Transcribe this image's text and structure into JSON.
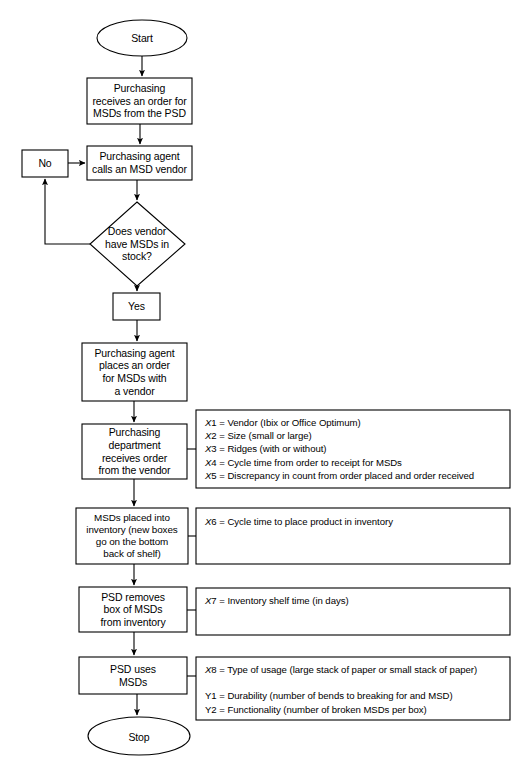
{
  "diagram": {
    "background_color": "#ffffff",
    "line_color": "#000000"
  },
  "flow": {
    "start": "Start",
    "stop": "Stop",
    "steps": [
      {
        "id": "receives-order",
        "text": "Purchasing\nreceives an order for\nMSDs from the PSD"
      },
      {
        "id": "calls-vendor",
        "text": "Purchasing agent\ncalls an MSD vendor"
      },
      {
        "id": "places-order",
        "text": "Purchasing agent\nplaces an order\nfor MSDs with\na vendor"
      },
      {
        "id": "receives-from-vendor",
        "text": "Purchasing\ndepartment\nreceives order\nfrom the vendor"
      },
      {
        "id": "placed-into-inventory",
        "text": "MSDs placed into\ninventory (new boxes\ngo on the bottom\nback of shelf)"
      },
      {
        "id": "psd-removes",
        "text": "PSD removes\nbox of MSDs\nfrom inventory"
      },
      {
        "id": "psd-uses",
        "text": "PSD uses\nMSDs"
      }
    ],
    "decision": {
      "id": "vendor-has-stock",
      "text": "Does vendor\nhave MSDs in\nstock?"
    },
    "branch_no": "No",
    "branch_yes": "Yes"
  },
  "annotations": [
    {
      "id": "vars-x1-x5",
      "lines": [
        {
          "var": "X",
          "num": "1",
          "sep": " = ",
          "desc": "Vendor (Ibix or Office Optimum)",
          "italic": true
        },
        {
          "var": "X",
          "num": "2",
          "sep": " = ",
          "desc": "Size (small or large)",
          "italic": true
        },
        {
          "var": "X",
          "num": "3",
          "sep": " = ",
          "desc": "Ridges (with or without)",
          "italic": true
        },
        {
          "var": "X",
          "num": "4",
          "sep": " = ",
          "desc": "Cycle time from order to receipt for MSDs",
          "italic": true
        },
        {
          "var": "X",
          "num": "5",
          "sep": " = ",
          "desc": "Discrepancy in count from order placed and order received",
          "italic": true
        }
      ]
    },
    {
      "id": "vars-x6",
      "lines": [
        {
          "var": "X",
          "num": "6",
          "sep": " = ",
          "desc": "Cycle time to place product in inventory",
          "italic": true
        }
      ]
    },
    {
      "id": "vars-x7",
      "lines": [
        {
          "var": "X",
          "num": "7",
          "sep": " = ",
          "desc": "Inventory shelf time (in days)",
          "italic": true
        }
      ]
    },
    {
      "id": "vars-x8-y1-y2",
      "lines": [
        {
          "var": "X",
          "num": "8",
          "sep": " = ",
          "desc": "Type of usage (large stack of paper or small stack of paper)",
          "italic": true
        },
        {
          "var": "",
          "num": "",
          "sep": "",
          "desc": "",
          "italic": false
        },
        {
          "var": "Y",
          "num": "1",
          "sep": " = ",
          "desc": "Durability (number of bends to breaking for and MSD)",
          "italic": false
        },
        {
          "var": "Y",
          "num": "2",
          "sep": " = ",
          "desc": "Functionality (number of broken MSDs per box)",
          "italic": false
        }
      ]
    }
  ]
}
